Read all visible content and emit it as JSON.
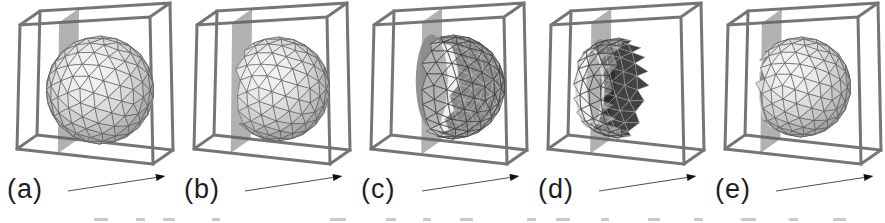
{
  "figure": {
    "kind": "sweep-plane-sequence",
    "panel_count": 5
  },
  "icons": {
    "sweep_arrow": "→"
  },
  "colors": {
    "background": "#ffffff",
    "cube_edge": "#757575",
    "plane_fill": "rgba(100,100,100,0.50)",
    "disk_fill": "#8a8a8a",
    "sphere_wire": "#565656",
    "sphere_shade_low": "#a2a2a2",
    "sphere_shade_high": "#f4f4f4",
    "interior_dark": "#151515",
    "interior_wire": "#a8a8a8",
    "translucent_fill": "rgba(224,224,224,0.45)",
    "translucent_dark": "rgba(24,24,24,0.82)",
    "cut_face": "#8d8d8d",
    "rim_light": "#d8d8d8",
    "arrow_line": "#3a3a3a",
    "arrow_head": "#111111",
    "label_color": "#1d1d1d"
  },
  "panels": [
    {
      "label": "(a)",
      "scene": {
        "plane": 0.3,
        "cx": 100,
        "cy": 90,
        "r": 54,
        "range": [
          -9,
          9
        ],
        "translucent": false,
        "disk": null,
        "cap": false,
        "rim": false
      }
    },
    {
      "label": "(b)",
      "scene": {
        "plane": 0.27,
        "cx": 101,
        "cy": 89,
        "r": 52,
        "range": [
          -0.56,
          9
        ],
        "translucent": false,
        "disk": null,
        "cap": false,
        "rim": false
      }
    },
    {
      "label": "(c)",
      "scene": {
        "plane": 0.37,
        "cx": 99,
        "cy": 87,
        "r": 52,
        "range": [
          -0.3,
          9
        ],
        "translucent": true,
        "disk": {
          "ry": 47
        },
        "cap": false,
        "rim": false
      }
    },
    {
      "label": "(d)",
      "scene": {
        "plane": 0.31,
        "cx": 88,
        "cy": 88,
        "r": 50,
        "range": [
          -0.62,
          0.14
        ],
        "translucent": true,
        "disk": {
          "ry": 42
        },
        "cap": false,
        "rim": true
      }
    },
    {
      "label": "(e)",
      "scene": {
        "plane": 0.26,
        "cx": 93,
        "cy": 87,
        "r": 50,
        "range": [
          -0.6,
          9
        ],
        "translucent": false,
        "disk": null,
        "cap": true,
        "rim": false
      }
    }
  ]
}
